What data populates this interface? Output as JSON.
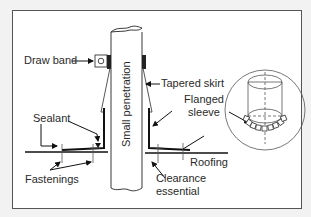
{
  "diagram": {
    "colors": {
      "background": "#f2f2f2",
      "panel": "#ffffff",
      "border": "#555555",
      "stroke": "#222222",
      "text": "#2a2a2a"
    },
    "labels": {
      "draw_band": "Draw band",
      "tapered_skirt": "Tapered skirt",
      "flanged_sleeve_line1": "Flanged",
      "flanged_sleeve_line2": "sleeve",
      "sealant": "Sealant",
      "fastenings": "Fastenings",
      "small_penetration": "Small penetration",
      "roofing": "Roofing",
      "clearance_line1": "Clearance",
      "clearance_line2": "essential"
    },
    "components": [
      {
        "id": "pipe",
        "name": "Small penetration"
      },
      {
        "id": "draw-band",
        "name": "Draw band"
      },
      {
        "id": "tapered-skirt",
        "name": "Tapered skirt"
      },
      {
        "id": "flanged-sleeve",
        "name": "Flanged sleeve"
      },
      {
        "id": "sealant",
        "name": "Sealant"
      },
      {
        "id": "fastenings",
        "name": "Fastenings"
      },
      {
        "id": "roofing",
        "name": "Roofing"
      },
      {
        "id": "detail-inset",
        "name": "Flanged sleeve 3D detail"
      }
    ]
  }
}
